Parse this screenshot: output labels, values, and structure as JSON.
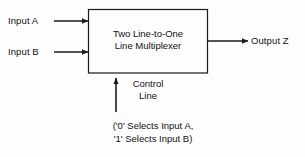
{
  "diagram": {
    "block": {
      "line1": "Two Line-to-One",
      "line2": "Line Multiplexer"
    },
    "inputs": [
      {
        "label": "Input A",
        "name": "input-a"
      },
      {
        "label": "Input B",
        "name": "input-b"
      }
    ],
    "output": {
      "label": "Output Z",
      "name": "output-z"
    },
    "control": {
      "line1": "Control",
      "line2": "Line"
    },
    "caption": {
      "line1": "('0' Selects Input A,",
      "line2": "'1' Selects Input B)"
    },
    "colors": {
      "stroke": "#1a1a1a",
      "background": "#fdfdfd",
      "text": "#111111"
    }
  }
}
